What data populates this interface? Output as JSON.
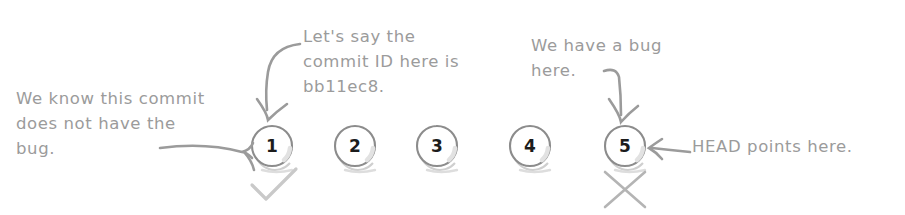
{
  "diagram": {
    "style": "hand-drawn sketch",
    "colors": {
      "ink": "#9b9b9b",
      "node_stroke": "#8c8c8c",
      "node_fill": "#ffffff",
      "numeral": "#1c1c1c",
      "mark": "#bdbdbd",
      "background": "#ffffff"
    },
    "commits": [
      {
        "label": "1",
        "cx": 272,
        "cy": 146,
        "r": 20
      },
      {
        "label": "2",
        "cx": 355,
        "cy": 146,
        "r": 20
      },
      {
        "label": "3",
        "cx": 437,
        "cy": 146,
        "r": 20
      },
      {
        "label": "4",
        "cx": 530,
        "cy": 146,
        "r": 20
      },
      {
        "label": "5",
        "cx": 625,
        "cy": 146,
        "r": 20
      }
    ],
    "annotations": {
      "known_good": "We know this commit\ndoes not have the\nbug.",
      "commit_id": "Let's say the\ncommit ID here is\nbb11ec8.",
      "bug_here": "We have a bug\nhere.",
      "head_pointer": "HEAD points here."
    },
    "marks": {
      "good_check": "check-mark",
      "bad_cross": "cross-mark"
    }
  }
}
